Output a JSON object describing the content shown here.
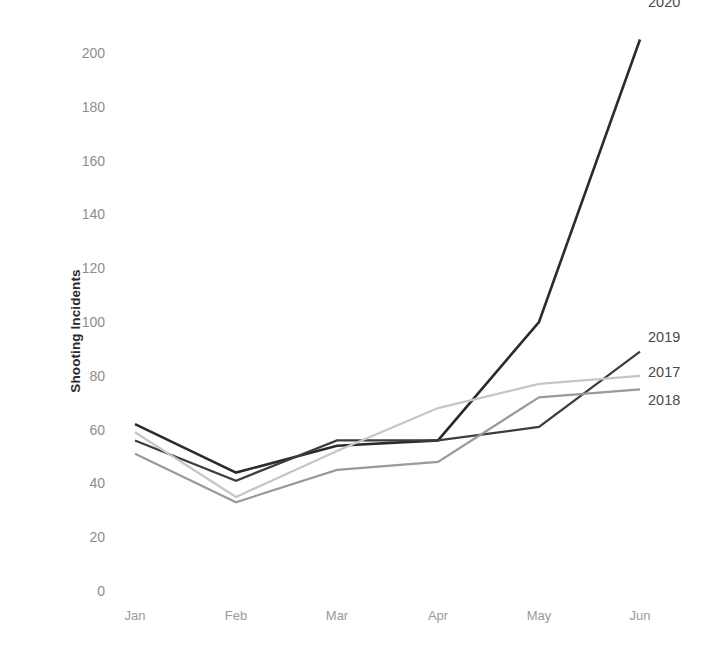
{
  "chart_data": {
    "type": "line",
    "title": "",
    "xlabel": "",
    "ylabel": "Shooting Incidents",
    "categories": [
      "Jan",
      "Feb",
      "Mar",
      "Apr",
      "May",
      "Jun"
    ],
    "ylim": [
      0,
      200
    ],
    "yticks": [
      0,
      20,
      40,
      60,
      80,
      100,
      120,
      140,
      160,
      180,
      200
    ],
    "grid": false,
    "legend_position": "right-end-labels",
    "series": [
      {
        "name": "2020",
        "color": "#2b2b2b",
        "width": 2.6,
        "values": [
          62,
          44,
          54,
          56,
          100,
          205
        ]
      },
      {
        "name": "2019",
        "color": "#3d3d3d",
        "width": 2.2,
        "values": [
          56,
          41,
          56,
          56,
          61,
          89
        ]
      },
      {
        "name": "2017",
        "color": "#c6c6c6",
        "width": 2.2,
        "values": [
          59,
          35,
          52,
          68,
          77,
          80
        ]
      },
      {
        "name": "2018",
        "color": "#9a9a9a",
        "width": 2.2,
        "values": [
          51,
          33,
          45,
          48,
          72,
          75
        ]
      }
    ]
  },
  "axis": {
    "ytick_labels": [
      "200",
      "180",
      "160",
      "140",
      "120",
      "100",
      "80",
      "60",
      "40",
      "20",
      "0"
    ],
    "xtick_labels": [
      "Jan",
      "Feb",
      "Mar",
      "Apr",
      "May",
      "Jun"
    ]
  },
  "series_end_labels": [
    {
      "text": "2020"
    },
    {
      "text": "2019"
    },
    {
      "text": "2017"
    },
    {
      "text": "2018"
    }
  ]
}
